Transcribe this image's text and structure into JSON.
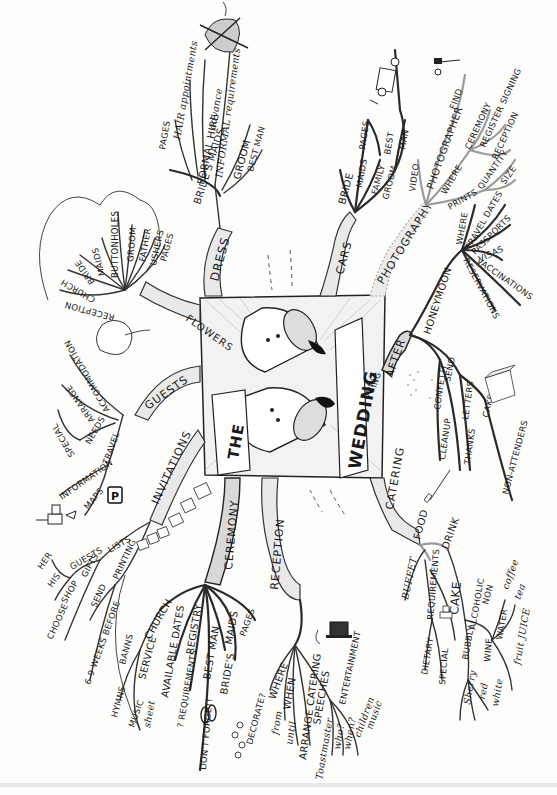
{
  "title": {
    "line1": "THE",
    "line2": "WEDDING",
    "line3": "DONG",
    "line4": "ING"
  },
  "branches": {
    "dress": {
      "label": "DRESS",
      "children": [
        "BRIDE'S MAIDS",
        "PAGES",
        "HAIR appointments",
        "FORMAL HIRE",
        "advance",
        "INFORMAL requirements",
        "GROOM",
        "BEST MAN"
      ]
    },
    "flowers": {
      "label": "FLOWERS",
      "children": [
        "RECEPTION",
        "CHURCH",
        "BRIDE",
        "MAIDS",
        "BUTTONHOLES",
        "GROOM",
        "FATHER",
        "USHERS",
        "PAGES"
      ]
    },
    "guests": {
      "label": "GUESTS",
      "children": [
        "ACCOMMODATION",
        "ARRANGE",
        "NEEDS",
        "SPECIAL",
        "TRAVEL",
        "INFORMATION",
        "MAPS"
      ]
    },
    "invitations": {
      "label": "INVITATIONS",
      "children": [
        "LISTS",
        "GUESTS",
        "HER",
        "HIS",
        "GIFTS",
        "SHOP",
        "CHOOSE",
        "PRINTING",
        "SEND",
        "6-9 WEEKS BEFORE"
      ]
    },
    "ceremony": {
      "label": "CEREMONY",
      "children": [
        "CHURCH",
        "BANNS",
        "SERVICE",
        "HYMNS",
        "MUSIC",
        "sheet",
        "AVAILABLE DATES",
        "REGISTRY",
        "? REQUIREMENTS",
        "BEST MAN",
        "DON'T FORGET!",
        "MAIDS",
        "PAGES",
        "BRIDE'S"
      ]
    },
    "reception": {
      "label": "RECEPTION",
      "children": [
        "WHERE",
        "DECORATE?",
        "WHEN",
        "from",
        "until",
        "ARRANGE CATERING",
        "SPEECHES",
        "Toastmaster",
        "ENTERTAINMENT",
        "who?",
        "when?",
        "children",
        "music"
      ]
    },
    "catering": {
      "label": "CATERING",
      "children": [
        "FOOD",
        "BUFFET",
        "REQUIREMENTS",
        "DIETARY",
        "SPECIAL",
        "CAKE",
        "DRINK",
        "ALCOHOLIC",
        "BUBBLY",
        "WINE",
        "Sherry",
        "red",
        "white",
        "NON",
        "WATER",
        "coffee",
        "tea",
        "fruit JUICE"
      ]
    },
    "after": {
      "label": "AFTER",
      "children": [
        "HONEYMOON",
        "WHERE",
        "TRAVEL DATES",
        "PASSPORTS",
        "VISAS",
        "RESERVATIONS",
        "VACCINATIONS",
        "SEND",
        "CONFETTI",
        "CLEANUP",
        "LETTERS",
        "THANKS",
        "CAKE",
        "NON-ATTENDERS"
      ]
    },
    "photography": {
      "label": "PHOTOGRAPHY",
      "children": [
        "VIDEO",
        "PHOTOGRAPHER",
        "FIND",
        "WHERE",
        "CEREMONY",
        "REGISTER SIGNING",
        "RECEPTION",
        "PRINTS",
        "QUANTITY",
        "SIZE"
      ]
    },
    "cars": {
      "label": "CARS",
      "children": [
        "BRIDE",
        "MAIDS",
        "PAGES",
        "FAMILY",
        "GROOM",
        "BEST",
        "MAN"
      ]
    }
  },
  "icons": {
    "parking_sign": "P"
  }
}
